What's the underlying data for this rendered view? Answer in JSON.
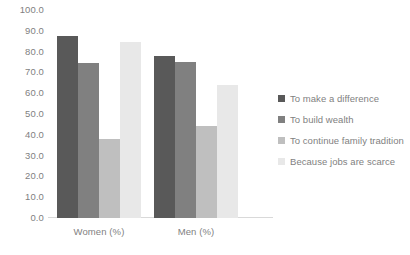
{
  "chart_data": {
    "type": "bar",
    "title": "",
    "subtitle": "",
    "xlabel": "",
    "ylabel": "",
    "categories": [
      "Women (%)",
      "Men (%)"
    ],
    "series": [
      {
        "name": "To make a difference",
        "values": [
          87.5,
          78.0
        ],
        "color": "#595959"
      },
      {
        "name": "To build wealth",
        "values": [
          74.5,
          75.0
        ],
        "color": "#808080"
      },
      {
        "name": "To continue family tradition",
        "values": [
          38.0,
          44.0
        ],
        "color": "#bfbfbf"
      },
      {
        "name": "Because jobs are scarce",
        "values": [
          84.5,
          64.0
        ],
        "color": "#e8e8e8"
      }
    ],
    "ylim": [
      0,
      100
    ],
    "ytick_step": 10,
    "ytick_labels": [
      "100.0",
      "90.0",
      "80.0",
      "70.0",
      "60.0",
      "50.0",
      "40.0",
      "30.0",
      "20.0",
      "10.0",
      "0.0"
    ],
    "ytick_values": [
      100,
      90,
      80,
      70,
      60,
      50,
      40,
      30,
      20,
      10,
      0
    ],
    "grid": false,
    "legend_position": "right",
    "axis_color": "#d9d9d9",
    "text_color": "#7f7f7f",
    "background": "#ffffff"
  }
}
